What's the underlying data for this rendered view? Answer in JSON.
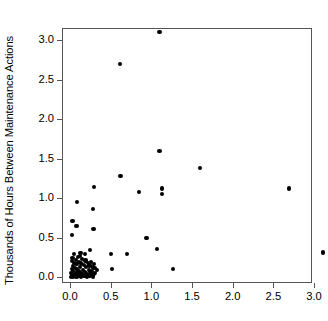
{
  "chart_data": {
    "type": "scatter",
    "title": "",
    "xlabel": "",
    "ylabel": "Thousands of Hours Between Maintenance Actions",
    "xlim": [
      -0.1,
      3.25
    ],
    "ylim": [
      -0.12,
      3.22
    ],
    "xticks": [
      0.0,
      0.5,
      1.0,
      1.5,
      2.0,
      2.5,
      3.0
    ],
    "xticklabels": [
      "0.0",
      "0.5",
      "1.0",
      "1.5",
      "2.0",
      "2.5",
      "3.0"
    ],
    "yticks": [
      0.0,
      0.5,
      1.0,
      1.5,
      2.0,
      2.5,
      3.0
    ],
    "yticklabels": [
      "0.0",
      "0.5",
      "1.0",
      "1.5",
      "2.0",
      "2.5",
      "3.0"
    ],
    "grid": false,
    "legend": null,
    "marker": {
      "shape": "circle",
      "color": "#000000",
      "size": 4.2
    },
    "points": [
      [
        1.1,
        3.1
      ],
      [
        0.61,
        2.7
      ],
      [
        1.1,
        1.6
      ],
      [
        1.6,
        1.38
      ],
      [
        0.62,
        1.28
      ],
      [
        0.3,
        1.14
      ],
      [
        1.13,
        1.12
      ],
      [
        2.69,
        1.12
      ],
      [
        0.85,
        1.08
      ],
      [
        1.13,
        1.05
      ],
      [
        0.09,
        0.95
      ],
      [
        0.28,
        0.86
      ],
      [
        0.03,
        0.71
      ],
      [
        0.08,
        0.65
      ],
      [
        0.29,
        0.61
      ],
      [
        0.02,
        0.53
      ],
      [
        0.94,
        0.49
      ],
      [
        1.07,
        0.35
      ],
      [
        0.25,
        0.34
      ],
      [
        3.11,
        0.31
      ],
      [
        0.05,
        0.29
      ],
      [
        0.18,
        0.29
      ],
      [
        0.5,
        0.29
      ],
      [
        0.7,
        0.29
      ],
      [
        0.12,
        0.27
      ],
      [
        0.1,
        0.25
      ],
      [
        0.03,
        0.24
      ],
      [
        0.15,
        0.23
      ],
      [
        0.07,
        0.22
      ],
      [
        0.19,
        0.21
      ],
      [
        0.02,
        0.2
      ],
      [
        0.11,
        0.19
      ],
      [
        0.22,
        0.18
      ],
      [
        0.05,
        0.175
      ],
      [
        0.14,
        0.17
      ],
      [
        0.3,
        0.165
      ],
      [
        0.08,
        0.16
      ],
      [
        0.17,
        0.15
      ],
      [
        0.24,
        0.145
      ],
      [
        0.04,
        0.14
      ],
      [
        0.12,
        0.13
      ],
      [
        0.2,
        0.125
      ],
      [
        0.28,
        0.12
      ],
      [
        0.06,
        0.115
      ],
      [
        0.31,
        0.11
      ],
      [
        0.52,
        0.1
      ],
      [
        1.27,
        0.1
      ],
      [
        0.02,
        0.1
      ],
      [
        0.09,
        0.095
      ],
      [
        0.16,
        0.09
      ],
      [
        0.23,
        0.085
      ],
      [
        0.27,
        0.08
      ],
      [
        0.04,
        0.075
      ],
      [
        0.11,
        0.07
      ],
      [
        0.18,
        0.065
      ],
      [
        0.25,
        0.06
      ],
      [
        0.01,
        0.055
      ],
      [
        0.07,
        0.05
      ],
      [
        0.13,
        0.048
      ],
      [
        0.2,
        0.045
      ],
      [
        0.29,
        0.042
      ],
      [
        0.03,
        0.04
      ],
      [
        0.09,
        0.035
      ],
      [
        0.15,
        0.032
      ],
      [
        0.22,
        0.03
      ],
      [
        0.26,
        0.028
      ],
      [
        0.05,
        0.025
      ],
      [
        0.1,
        0.022
      ],
      [
        0.17,
        0.02
      ],
      [
        0.24,
        0.018
      ],
      [
        0.02,
        0.015
      ],
      [
        0.06,
        0.012
      ],
      [
        0.12,
        0.01
      ],
      [
        0.19,
        0.008
      ],
      [
        0.28,
        0.006
      ],
      [
        0.01,
        0.005
      ],
      [
        0.08,
        0.004
      ],
      [
        0.14,
        0.003
      ],
      [
        0.21,
        0.002
      ],
      [
        0.04,
        0.001
      ],
      [
        0.31,
        0.05
      ],
      [
        0.33,
        0.09
      ],
      [
        0.26,
        0.19
      ],
      [
        0.13,
        0.3
      ]
    ]
  }
}
